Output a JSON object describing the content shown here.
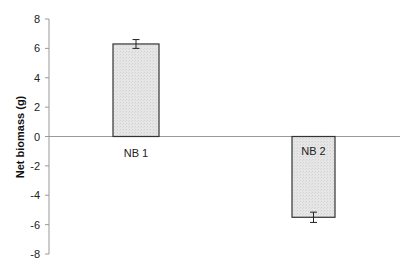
{
  "chart_data": {
    "type": "bar",
    "title": "",
    "xlabel": "",
    "ylabel": "Net biomass (g)",
    "categories": [
      "NB 1",
      "NB 2"
    ],
    "values": [
      6.3,
      -5.5
    ],
    "errors": [
      0.3,
      0.35
    ],
    "ylim": [
      -8,
      8
    ],
    "yticks": [
      8,
      6,
      4,
      2,
      0,
      -2,
      -4,
      -6,
      -8
    ],
    "grid": false,
    "legend": null,
    "bar_fill": "#e3e3e3",
    "bar_stroke": "#333333",
    "axis_color": "#999999"
  }
}
